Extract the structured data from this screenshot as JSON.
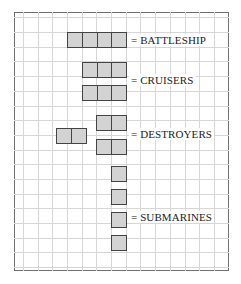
{
  "diagram": {
    "colors": {
      "ship_fill": "#d3d3d3",
      "ship_border": "#444444",
      "grid_line": "#d6d6d6",
      "frame": "#707070"
    },
    "labels": {
      "battleship": "= BATTLESHIP",
      "cruisers": "= CRUISERS",
      "destroyers": "= DESTROYERS",
      "submarines": "= SUBMARINES"
    },
    "ships": [
      {
        "type": "battleship",
        "cells": 4
      },
      {
        "type": "cruiser",
        "cells": 3
      },
      {
        "type": "cruiser",
        "cells": 3
      },
      {
        "type": "destroyer",
        "cells": 2
      },
      {
        "type": "destroyer",
        "cells": 2
      },
      {
        "type": "destroyer",
        "cells": 2
      },
      {
        "type": "submarine",
        "cells": 1
      },
      {
        "type": "submarine",
        "cells": 1
      },
      {
        "type": "submarine",
        "cells": 1
      },
      {
        "type": "submarine",
        "cells": 1
      }
    ]
  }
}
